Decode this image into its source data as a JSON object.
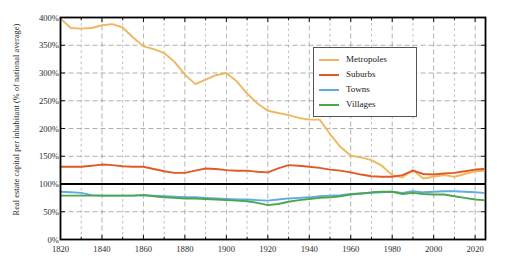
{
  "chart_data": {
    "type": "line",
    "title": "",
    "xlabel": "",
    "ylabel": "Real estate capital per inhabitant (% of national average)",
    "xlim": [
      1820,
      2025
    ],
    "ylim": [
      0,
      400
    ],
    "xticks": [
      1820,
      1840,
      1860,
      1880,
      1900,
      1920,
      1940,
      1960,
      1980,
      2000,
      2020
    ],
    "xtick_labels": [
      "1820",
      "1840",
      "1860",
      "1880",
      "1900",
      "1920",
      "1940",
      "1960",
      "1980",
      "2000",
      "2020"
    ],
    "xminor_step": 10,
    "yticks": [
      0,
      50,
      100,
      150,
      200,
      250,
      300,
      350,
      400
    ],
    "ytick_labels": [
      "0%",
      "50%",
      "100%",
      "150%",
      "200%",
      "250%",
      "300%",
      "350%",
      "400%"
    ],
    "grid": true,
    "grid_style": "dashed",
    "reference_line": {
      "value": 100,
      "color": "#000000",
      "width": 1.8
    },
    "legend_position": "upper-right-inset",
    "series": [
      {
        "name": "Metropoles",
        "color": "#f0b75f",
        "x": [
          1820,
          1825,
          1830,
          1835,
          1840,
          1845,
          1850,
          1855,
          1860,
          1865,
          1870,
          1875,
          1880,
          1885,
          1890,
          1895,
          1900,
          1905,
          1910,
          1915,
          1920,
          1925,
          1930,
          1935,
          1940,
          1945,
          1950,
          1955,
          1960,
          1965,
          1970,
          1975,
          1980,
          1985,
          1990,
          1995,
          2000,
          2005,
          2010,
          2015,
          2020,
          2024
        ],
        "values": [
          398,
          381,
          380,
          381,
          386,
          388,
          382,
          364,
          348,
          343,
          336,
          320,
          297,
          280,
          288,
          296,
          300,
          285,
          263,
          245,
          232,
          228,
          224,
          219,
          216,
          216,
          190,
          167,
          151,
          148,
          143,
          133,
          116,
          112,
          125,
          110,
          113,
          116,
          113,
          118,
          123,
          124
        ]
      },
      {
        "name": "Suburbs",
        "color": "#e15a26",
        "x": [
          1820,
          1825,
          1830,
          1835,
          1840,
          1845,
          1850,
          1855,
          1860,
          1865,
          1870,
          1875,
          1880,
          1885,
          1890,
          1895,
          1900,
          1905,
          1910,
          1915,
          1920,
          1925,
          1930,
          1935,
          1940,
          1945,
          1950,
          1955,
          1960,
          1965,
          1970,
          1975,
          1980,
          1985,
          1990,
          1995,
          2000,
          2005,
          2010,
          2015,
          2020,
          2024
        ],
        "values": [
          131,
          131,
          131,
          133,
          135,
          134,
          132,
          131,
          131,
          127,
          123,
          120,
          120,
          124,
          128,
          127,
          125,
          124,
          124,
          122,
          121,
          128,
          134,
          133,
          131,
          129,
          126,
          124,
          121,
          117,
          114,
          113,
          113,
          116,
          124,
          118,
          117,
          119,
          120,
          123,
          126,
          127
        ]
      },
      {
        "name": "Towns",
        "color": "#5fabe3",
        "x": [
          1820,
          1825,
          1830,
          1835,
          1840,
          1845,
          1850,
          1855,
          1860,
          1865,
          1870,
          1875,
          1880,
          1885,
          1890,
          1895,
          1900,
          1905,
          1910,
          1915,
          1920,
          1925,
          1930,
          1935,
          1940,
          1945,
          1950,
          1955,
          1960,
          1965,
          1970,
          1975,
          1980,
          1985,
          1990,
          1995,
          2000,
          2005,
          2010,
          2015,
          2020,
          2024
        ],
        "values": [
          86,
          85,
          84,
          80,
          79,
          79,
          79,
          79,
          80,
          79,
          78,
          77,
          76,
          76,
          75,
          74,
          73,
          72,
          72,
          71,
          70,
          72,
          74,
          75,
          76,
          78,
          79,
          80,
          82,
          83,
          84,
          85,
          86,
          84,
          87,
          85,
          86,
          87,
          87,
          86,
          85,
          84
        ]
      },
      {
        "name": "Villages",
        "color": "#4ca64c",
        "x": [
          1820,
          1825,
          1830,
          1835,
          1840,
          1845,
          1850,
          1855,
          1860,
          1865,
          1870,
          1875,
          1880,
          1885,
          1890,
          1895,
          1900,
          1905,
          1910,
          1915,
          1920,
          1925,
          1930,
          1935,
          1940,
          1945,
          1950,
          1955,
          1960,
          1965,
          1970,
          1975,
          1980,
          1985,
          1990,
          1995,
          2000,
          2005,
          2010,
          2015,
          2020,
          2024
        ],
        "values": [
          79,
          79,
          79,
          79,
          79,
          79,
          79,
          79,
          80,
          78,
          76,
          75,
          74,
          74,
          73,
          72,
          71,
          70,
          69,
          66,
          62,
          64,
          68,
          71,
          73,
          75,
          76,
          78,
          81,
          83,
          85,
          86,
          86,
          82,
          84,
          82,
          81,
          81,
          78,
          75,
          72,
          71
        ]
      }
    ]
  },
  "legend": {
    "items": [
      {
        "label": "Metropoles",
        "color": "#f0b75f"
      },
      {
        "label": "Suburbs",
        "color": "#e15a26"
      },
      {
        "label": "Towns",
        "color": "#5fabe3"
      },
      {
        "label": "Villages",
        "color": "#4ca64c"
      }
    ]
  }
}
